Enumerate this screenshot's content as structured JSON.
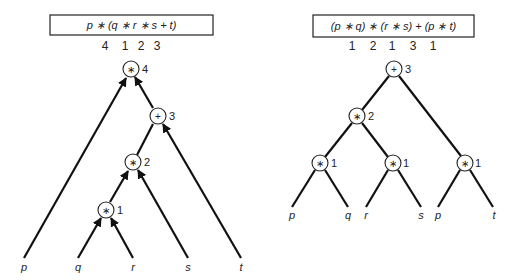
{
  "left_tree": {
    "expression": "p ∗ (q ∗ r ∗ s + t)",
    "precedence_numbers": [
      "4",
      "1",
      "2",
      "3"
    ],
    "nodes": [
      {
        "op": "∗",
        "order": "4"
      },
      {
        "op": "+",
        "order": "3"
      },
      {
        "op": "∗",
        "order": "2"
      },
      {
        "op": "∗",
        "order": "1"
      }
    ],
    "leaves": [
      "p",
      "q",
      "r",
      "s",
      "t"
    ],
    "edge_style": "arrows pointing up toward parent"
  },
  "right_tree": {
    "expression": "(p ∗ q) ∗ (r ∗ s) + (p ∗ t)",
    "precedence_numbers": [
      "1",
      "2",
      "1",
      "3",
      "1"
    ],
    "nodes": [
      {
        "op": "+",
        "order": "3"
      },
      {
        "op": "∗",
        "order": "2"
      },
      {
        "op": "∗",
        "order": "1"
      },
      {
        "op": "∗",
        "order": "1"
      },
      {
        "op": "∗",
        "order": "1"
      }
    ],
    "leaves": [
      "p",
      "q",
      "r",
      "s",
      "p",
      "t"
    ],
    "edge_style": "plain lines"
  }
}
